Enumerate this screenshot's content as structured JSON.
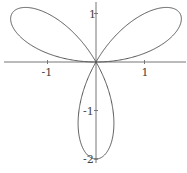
{
  "chart_data": {
    "type": "line",
    "title": "",
    "xlabel": "",
    "ylabel": "",
    "equation": "r = 2 sin(3θ)",
    "xlim": [
      -1.9,
      1.9
    ],
    "ylim": [
      -2.1,
      1.25
    ],
    "grid": false,
    "legend": null,
    "x_ticks": [
      {
        "value": -1,
        "label": "-1"
      },
      {
        "value": 1,
        "label": "1"
      }
    ],
    "y_ticks": [
      {
        "value": 1,
        "label": "1"
      },
      {
        "value": -1,
        "label": "-1"
      },
      {
        "value": -2,
        "label": "-2"
      }
    ],
    "petal_tips": [
      {
        "x": 1.732,
        "y": 1.0
      },
      {
        "x": -1.732,
        "y": 1.0
      },
      {
        "x": 0.0,
        "y": -2.0
      }
    ],
    "series": [
      {
        "name": "r = 2 sin(3θ)",
        "color": "#555555"
      }
    ]
  },
  "layout": {
    "origin_px": [
      96,
      62
    ],
    "px_per_unit": 48.5
  }
}
